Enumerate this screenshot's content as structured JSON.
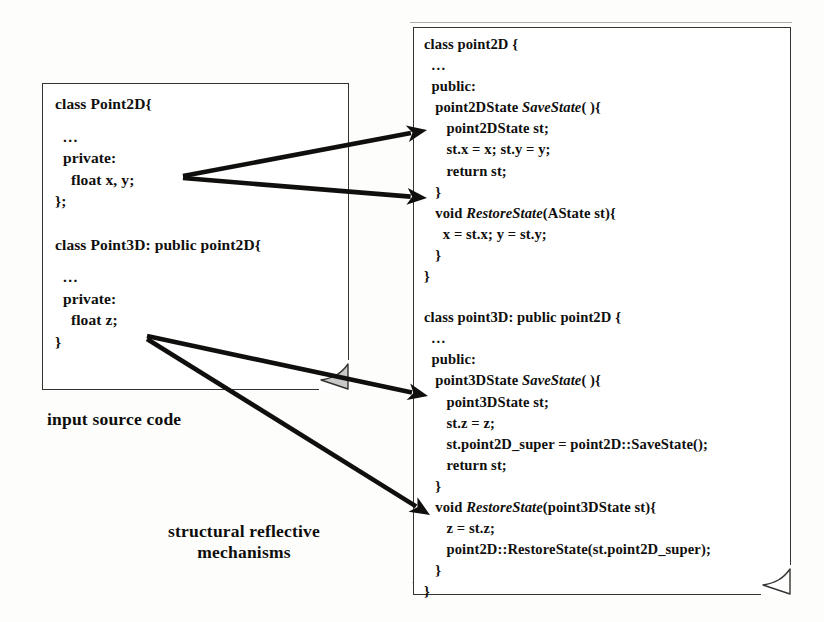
{
  "figure": {
    "background_color": "#fdfdfc",
    "ink_color": "#100f0d",
    "curl_fill_color": "#c9c9c9"
  },
  "input_panel": {
    "name": "input source code panel",
    "lines": [
      {
        "text": "class Point2D{",
        "indent": 0,
        "italic_part": ""
      },
      {
        "text": "",
        "blank": true
      },
      {
        "text": "  ...",
        "indent": 0
      },
      {
        "text": "  private:",
        "indent": 0
      },
      {
        "text": "    float x, y;",
        "indent": 0
      },
      {
        "text": "};",
        "indent": 0
      },
      {
        "text": "",
        "blank": true
      },
      {
        "text": "",
        "blank": true
      },
      {
        "text": "class Point3D: public point2D{",
        "indent": 0
      },
      {
        "text": "",
        "blank": true
      },
      {
        "text": "  ...",
        "indent": 0
      },
      {
        "text": "  private:",
        "indent": 0
      },
      {
        "text": "    float z;",
        "indent": 0
      },
      {
        "text": "}",
        "indent": 0
      }
    ]
  },
  "output_panel": {
    "name": "structural reflective mechanisms panel",
    "lines": [
      {
        "pre": "class point2D {",
        "mi": "",
        "post": ""
      },
      {
        "pre": "  ...",
        "mi": "",
        "post": ""
      },
      {
        "pre": "  public:",
        "mi": "",
        "post": ""
      },
      {
        "pre": "   point2DState ",
        "mi": "SaveState",
        "post": "( ){"
      },
      {
        "pre": "      point2DState st;",
        "mi": "",
        "post": ""
      },
      {
        "pre": "      st.x = x; st.y = y;",
        "mi": "",
        "post": ""
      },
      {
        "pre": "      return st;",
        "mi": "",
        "post": ""
      },
      {
        "pre": "   }",
        "mi": "",
        "post": ""
      },
      {
        "pre": "   void ",
        "mi": "RestoreState",
        "post": "(AState st){"
      },
      {
        "pre": "     x = st.x; y = st.y;",
        "mi": "",
        "post": ""
      },
      {
        "pre": "   }",
        "mi": "",
        "post": ""
      },
      {
        "pre": "}",
        "mi": "",
        "post": ""
      },
      {
        "pre": "",
        "mi": "",
        "post": "",
        "blank": true
      },
      {
        "pre": "",
        "mi": "",
        "post": "",
        "blank": true
      },
      {
        "pre": "class point3D: public point2D {",
        "mi": "",
        "post": ""
      },
      {
        "pre": "  ...",
        "mi": "",
        "post": ""
      },
      {
        "pre": "  public:",
        "mi": "",
        "post": ""
      },
      {
        "pre": "   point3DState ",
        "mi": "SaveState",
        "post": "( ){"
      },
      {
        "pre": "      point3DState st;",
        "mi": "",
        "post": ""
      },
      {
        "pre": "      st.z = z;",
        "mi": "",
        "post": ""
      },
      {
        "pre": "      st.point2D_super = point2D::SaveState();",
        "mi": "",
        "post": ""
      },
      {
        "pre": "      return st;",
        "mi": "",
        "post": ""
      },
      {
        "pre": "   }",
        "mi": "",
        "post": ""
      },
      {
        "pre": "   void ",
        "mi": "RestoreState",
        "post": "(point3DState st){"
      },
      {
        "pre": "      z = st.z;",
        "mi": "",
        "post": ""
      },
      {
        "pre": "      point2D::RestoreState(st.point2D_super);",
        "mi": "",
        "post": ""
      },
      {
        "pre": "   }",
        "mi": "",
        "post": ""
      },
      {
        "pre": "}",
        "mi": "",
        "post": ""
      }
    ]
  },
  "captions": {
    "input": "input source code",
    "mechanisms_line1": "structural reflective",
    "mechanisms_line2": "mechanisms"
  },
  "arrows": [
    {
      "name": "x-y-to-savestate",
      "from": [
        183,
        176
      ],
      "to": [
        427,
        130
      ]
    },
    {
      "name": "x-y-to-restorestate",
      "from": [
        183,
        178
      ],
      "to": [
        427,
        198
      ]
    },
    {
      "name": "z-to-savestate3d",
      "from": [
        147,
        336
      ],
      "to": [
        428,
        396
      ]
    },
    {
      "name": "z-to-restorestate3d",
      "from": [
        147,
        339
      ],
      "to": [
        430,
        515
      ]
    }
  ]
}
